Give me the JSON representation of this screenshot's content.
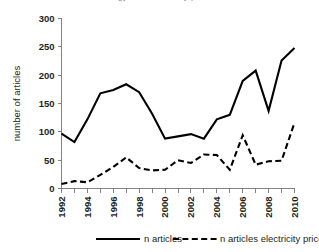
{
  "clipped_header": {
    "text": "number of articles on energy and electricity price"
  },
  "chart_data": {
    "type": "line",
    "title": "",
    "subtitle": "",
    "xlabel": "",
    "ylabel": "number of articles",
    "xlim": [
      1992,
      2010
    ],
    "ylim": [
      0,
      300
    ],
    "ytick_step": 50,
    "yticks": [
      0,
      50,
      100,
      150,
      200,
      250,
      300
    ],
    "ytick_labels": [
      "0",
      "50",
      "100",
      "150",
      "200",
      "250",
      "300"
    ],
    "x": [
      1992,
      1993,
      1994,
      1995,
      1996,
      1997,
      1998,
      1999,
      2000,
      2001,
      2002,
      2003,
      2004,
      2005,
      2006,
      2007,
      2008,
      2009,
      2010
    ],
    "xticks_all": [
      1992,
      1993,
      1994,
      1995,
      1996,
      1997,
      1998,
      1999,
      2000,
      2001,
      2002,
      2003,
      2004,
      2005,
      2006,
      2007,
      2008,
      2009,
      2010
    ],
    "xtick_labels_shown": [
      "1992",
      "1994",
      "1996",
      "1998",
      "2000",
      "2002",
      "2004",
      "2006",
      "2008",
      "2010"
    ],
    "xtick_label_years": [
      1992,
      1994,
      1996,
      1998,
      2000,
      2002,
      2004,
      2006,
      2008,
      2010
    ],
    "xtick_label_rotation": -90,
    "grid": false,
    "legend_position": "bottom",
    "series": [
      {
        "name": "n articles",
        "style": "solid",
        "color": "#000000",
        "values": [
          97,
          82,
          122,
          168,
          174,
          184,
          170,
          132,
          88,
          92,
          96,
          88,
          122,
          130,
          190,
          208,
          137,
          226,
          248
        ]
      },
      {
        "name": "n articles electricity price",
        "style": "dashed",
        "color": "#000000",
        "values": [
          8,
          13,
          11,
          24,
          38,
          55,
          36,
          32,
          33,
          50,
          45,
          60,
          59,
          33,
          94,
          42,
          48,
          49,
          116
        ]
      }
    ]
  },
  "legend": {
    "items": [
      {
        "label": "n articles",
        "style": "solid"
      },
      {
        "label": "n articles electricity price",
        "style": "dashed"
      }
    ]
  },
  "colors": {
    "axis": "#808285",
    "text": "#231f20",
    "series": "#000000",
    "background": "#ffffff"
  }
}
